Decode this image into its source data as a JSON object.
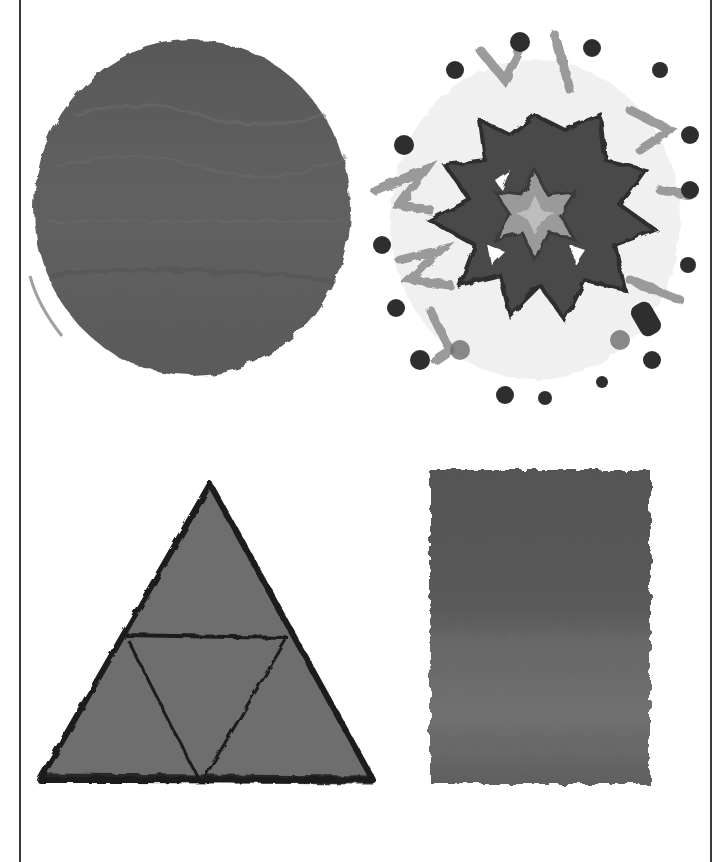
{
  "illustration": {
    "shapes": [
      {
        "id": "circle",
        "label": "painted circle",
        "fill": "#5e5e5e"
      },
      {
        "id": "starburst",
        "label": "painted starburst explosion",
        "fill": "#4a4a4a"
      },
      {
        "id": "triangle",
        "label": "painted triangle divided into four triangles",
        "fill": "#6e6e6e",
        "stroke": "#1e1e1e"
      },
      {
        "id": "rectangle",
        "label": "painted rectangle",
        "fill": "#626262"
      }
    ]
  },
  "colors": {
    "background": "#ffffff",
    "frame_line": "#3a3a3a"
  }
}
